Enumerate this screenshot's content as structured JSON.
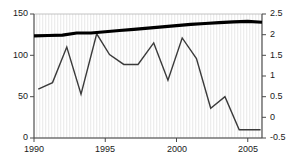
{
  "chart_data": {
    "type": "line",
    "title": "",
    "subtitle": "",
    "xlabel": "",
    "ylabel": "",
    "y2label": "",
    "grid": "vertical-stripes",
    "legend": "none",
    "xlim": [
      1990,
      2006
    ],
    "ylim": [
      0,
      150
    ],
    "y2lim": [
      -0.5,
      2.5
    ],
    "xticks": [
      1990,
      1995,
      2000,
      2005
    ],
    "xtick_labels": [
      "1990",
      "1995",
      "2000",
      "2005"
    ],
    "yticks": [
      0,
      50,
      100,
      150
    ],
    "ytick_labels": [
      "0",
      "50",
      "100",
      "150"
    ],
    "y2ticks": [
      -0.5,
      0,
      0.5,
      1,
      1.5,
      2,
      2.5
    ],
    "y2tick_labels": [
      "-0.5",
      "0",
      "0.5",
      "1",
      "1.5",
      "2",
      "2.5"
    ],
    "series": [
      {
        "name": "thin-jagged-series",
        "axis": "left",
        "color": "#3b3b3b",
        "width": 1.4,
        "x": [
          1990.3,
          1991.3,
          1992.3,
          1993.3,
          1994.4,
          1995.3,
          1996.3,
          1997.3,
          1998.4,
          1999.4,
          2000.4,
          2001.4,
          2002.4,
          2003.4,
          2004.4,
          2005.9
        ],
        "values": [
          59,
          67,
          110,
          53,
          126,
          101,
          89,
          89,
          115,
          70,
          121,
          96,
          36,
          50,
          10,
          10
        ]
      },
      {
        "name": "thick-smooth-series",
        "axis": "right",
        "color": "#000000",
        "width": 3.2,
        "x": [
          1990,
          1991,
          1992,
          1993,
          1994,
          1995,
          1996,
          1997,
          1998,
          1999,
          2000,
          2001,
          2002,
          2003,
          2004,
          2005,
          2006
        ],
        "values": [
          1.97,
          1.98,
          1.99,
          2.04,
          2.04,
          2.07,
          2.1,
          2.13,
          2.16,
          2.19,
          2.22,
          2.25,
          2.27,
          2.29,
          2.31,
          2.32,
          2.3
        ]
      }
    ]
  },
  "axis_labels": {
    "left": [
      "150",
      "100",
      "50",
      "0"
    ],
    "right": [
      "2.5",
      "2",
      "1.5",
      "1",
      "0.5",
      "0",
      "-0.5"
    ],
    "bottom": [
      "1990",
      "1995",
      "2000",
      "2005"
    ]
  },
  "colors": {
    "plot_background": "#ffffff",
    "stripe": "#ededed",
    "border": "#b4b4b4",
    "thick_line": "#000000",
    "thin_line": "#3b3b3b",
    "tick_text": "#1a1a1a"
  }
}
